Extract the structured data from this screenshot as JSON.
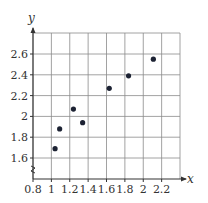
{
  "chart_data": {
    "type": "scatter",
    "title": "",
    "xlabel": "x",
    "ylabel": "y",
    "xlim": [
      0.8,
      2.4
    ],
    "ylim": [
      1.4,
      2.8
    ],
    "grid": true,
    "x_ticks": [
      "0.8",
      "1",
      "1.2",
      "1.4",
      "1.6",
      "1.8",
      "2",
      "2.2"
    ],
    "y_ticks": [
      "1.6",
      "1.8",
      "2",
      "2.2",
      "2.4",
      "2.6"
    ],
    "axis_break_on_y": true,
    "points": [
      {
        "x": 1.04,
        "y": 1.69
      },
      {
        "x": 1.09,
        "y": 1.88
      },
      {
        "x": 1.24,
        "y": 2.07
      },
      {
        "x": 1.34,
        "y": 1.94
      },
      {
        "x": 1.63,
        "y": 2.27
      },
      {
        "x": 1.84,
        "y": 2.39
      },
      {
        "x": 2.11,
        "y": 2.55
      }
    ],
    "colors": {
      "point": "#1c2233",
      "grid": "#8a8a8a",
      "axis": "#333333"
    }
  }
}
